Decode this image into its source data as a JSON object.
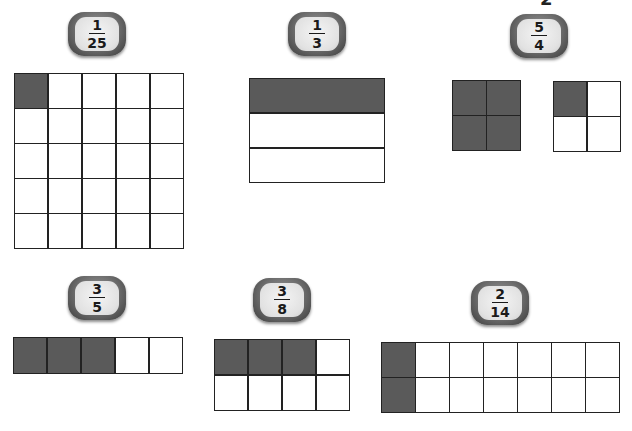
{
  "page": {
    "edge_glyph": "2"
  },
  "figures": [
    {
      "id": "one-twenty-fifth",
      "fraction": {
        "numerator": "1",
        "denominator": "25"
      },
      "models": [
        {
          "rows": 5,
          "cols": 5,
          "shaded": [
            [
              0,
              0
            ]
          ]
        }
      ]
    },
    {
      "id": "one-third",
      "fraction": {
        "numerator": "1",
        "denominator": "3"
      },
      "models": [
        {
          "rows": 3,
          "cols": 1,
          "shaded": [
            [
              0,
              0
            ]
          ]
        }
      ]
    },
    {
      "id": "five-fourths",
      "fraction": {
        "numerator": "5",
        "denominator": "4"
      },
      "models": [
        {
          "rows": 2,
          "cols": 2,
          "shaded": [
            [
              0,
              0
            ],
            [
              0,
              1
            ],
            [
              1,
              0
            ],
            [
              1,
              1
            ]
          ]
        },
        {
          "rows": 2,
          "cols": 2,
          "shaded": [
            [
              0,
              0
            ]
          ]
        }
      ]
    },
    {
      "id": "three-fifths",
      "fraction": {
        "numerator": "3",
        "denominator": "5"
      },
      "models": [
        {
          "rows": 1,
          "cols": 5,
          "shaded": [
            [
              0,
              0
            ],
            [
              0,
              1
            ],
            [
              0,
              2
            ]
          ]
        }
      ]
    },
    {
      "id": "three-eighths",
      "fraction": {
        "numerator": "3",
        "denominator": "8"
      },
      "models": [
        {
          "rows": 2,
          "cols": 4,
          "shaded": [
            [
              0,
              0
            ],
            [
              0,
              1
            ],
            [
              0,
              2
            ]
          ]
        }
      ]
    },
    {
      "id": "two-fourteenths",
      "fraction": {
        "numerator": "2",
        "denominator": "14"
      },
      "models": [
        {
          "rows": 2,
          "cols": 7,
          "shaded": [
            [
              0,
              0
            ],
            [
              1,
              0
            ]
          ]
        }
      ]
    }
  ],
  "colors": {
    "shaded": "#5a5a5a",
    "unshaded": "#ffffff",
    "grid_line": "#222222"
  }
}
